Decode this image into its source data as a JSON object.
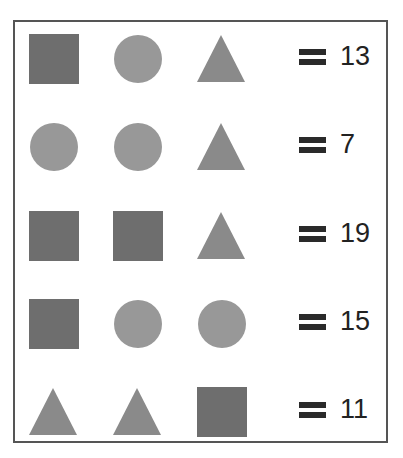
{
  "puzzle": {
    "rows": [
      {
        "shapes": [
          "square",
          "circle",
          "triangle"
        ],
        "equals_symbol": "=",
        "value": "13"
      },
      {
        "shapes": [
          "circle",
          "circle",
          "triangle"
        ],
        "equals_symbol": "=",
        "value": "7"
      },
      {
        "shapes": [
          "square",
          "square",
          "triangle"
        ],
        "equals_symbol": "=",
        "value": "19"
      },
      {
        "shapes": [
          "square",
          "circle",
          "circle"
        ],
        "equals_symbol": "=",
        "value": "15"
      },
      {
        "shapes": [
          "triangle",
          "triangle",
          "square"
        ],
        "equals_symbol": "=",
        "value": "11"
      }
    ],
    "colors": {
      "square": "#6e6e6e",
      "circle": "#989898",
      "triangle": "#8a8a8a",
      "border": "#555555",
      "text": "#222222"
    }
  }
}
